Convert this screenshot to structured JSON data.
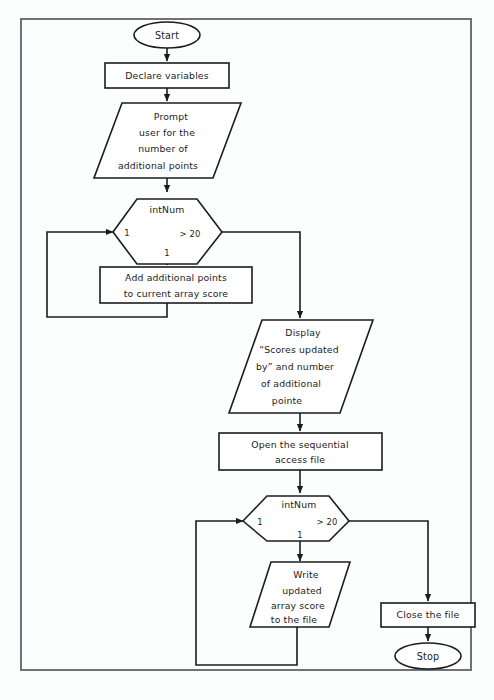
{
  "document": {
    "kind": "flowchart",
    "title": "Array score update flowchart",
    "frame_border_color": "#6f7276",
    "shape_stroke_color": "#1b1c1e",
    "shape_fill_color": "#ffffff",
    "page_background_color": "#fcfdfd"
  },
  "nodes": {
    "start": {
      "type": "terminator",
      "label": "Start"
    },
    "declare": {
      "type": "process",
      "label": "Declare variables"
    },
    "prompt": {
      "type": "input",
      "lines": [
        "Prompt",
        "user for the",
        "number of",
        "additional points"
      ]
    },
    "loop1": {
      "type": "loop",
      "variable": "intNum",
      "start_value": "1",
      "condition": "> 20",
      "step_value": "1"
    },
    "add_points": {
      "type": "process",
      "lines": [
        "Add additional points",
        "to current array score"
      ]
    },
    "display": {
      "type": "output",
      "lines": [
        "Display",
        "“Scores updated",
        "by” and number",
        "of additional",
        "pointe"
      ]
    },
    "open_file": {
      "type": "process",
      "lines": [
        "Open the sequential",
        "access file"
      ]
    },
    "loop2": {
      "type": "loop",
      "variable": "intNum",
      "start_value": "1",
      "condition": "> 20",
      "step_value": "1"
    },
    "write_file": {
      "type": "output",
      "lines": [
        "Write",
        "updated",
        "array score",
        "to the file"
      ]
    },
    "close_file": {
      "type": "process",
      "label": "Close the file"
    },
    "stop": {
      "type": "terminator",
      "label": "Stop"
    }
  }
}
